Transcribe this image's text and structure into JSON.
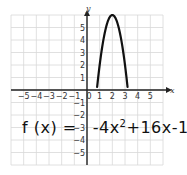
{
  "chart_data": {
    "type": "line",
    "title": "",
    "xlabel": "x",
    "ylabel": "y",
    "xlim": [
      -6,
      6
    ],
    "ylim": [
      -6,
      6
    ],
    "grid": true,
    "x_ticks": [
      "-5",
      "-4",
      "-3",
      "-2",
      "-1",
      "0",
      "1",
      "2",
      "3",
      "4",
      "5"
    ],
    "y_ticks": [
      "5",
      "4",
      "3",
      "2",
      "1",
      "-1",
      "-2",
      "-3",
      "-4",
      "-5"
    ],
    "series": [
      {
        "name": "f(x) = -4x^2 + 16x - 10",
        "x": [
          0.8,
          1.0,
          1.25,
          1.5,
          1.75,
          2.0,
          2.25,
          2.5,
          2.75,
          3.0,
          3.2
        ],
        "y": [
          0.24,
          2.0,
          3.75,
          5.0,
          5.75,
          6.0,
          5.75,
          5.0,
          3.75,
          2.0,
          0.24
        ]
      }
    ],
    "annotations": [
      {
        "text": "f(x) = -4x² + 16x - 10",
        "style": "handwritten"
      }
    ]
  },
  "equation": {
    "lhs": "f (x) =",
    "rhs_a": "-4x",
    "rhs_exp": "2",
    "rhs_b": "+16x-10"
  },
  "axis_labels": {
    "x": "x",
    "y": "y"
  },
  "colors": {
    "grid": "#d8d8d8",
    "axis": "#222222",
    "curve": "#111111"
  }
}
